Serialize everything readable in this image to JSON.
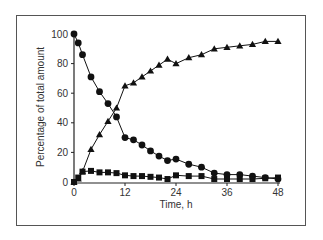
{
  "chart_data": {
    "type": "line",
    "title": "",
    "xlabel": "Time, h",
    "ylabel": "Percentage of total amount",
    "xlim": [
      0,
      48
    ],
    "ylim": [
      0,
      100
    ],
    "xticks": [
      0,
      12,
      24,
      36,
      48
    ],
    "yticks": [
      0,
      20,
      40,
      60,
      80,
      100
    ],
    "grid": false,
    "legend": null,
    "x": [
      0,
      1,
      2,
      4,
      6,
      8,
      10,
      12,
      14,
      16,
      18,
      20,
      22,
      24,
      27,
      30,
      33,
      36,
      39,
      42,
      45,
      48
    ],
    "series": [
      {
        "name": "circles",
        "marker": "circle",
        "color": "#111111",
        "values": [
          100,
          94,
          86,
          71,
          61,
          53,
          44,
          30,
          28.5,
          25,
          21,
          17.5,
          14.5,
          15.5,
          12,
          10,
          6,
          5,
          5,
          4,
          3,
          2
        ]
      },
      {
        "name": "triangles",
        "marker": "triangle",
        "color": "#111111",
        "values": [
          0,
          2,
          7,
          22,
          32,
          41,
          50,
          65,
          67,
          71,
          75,
          79,
          83,
          80,
          84,
          86,
          90,
          91,
          92,
          93,
          95,
          95
        ]
      },
      {
        "name": "squares",
        "marker": "square",
        "color": "#111111",
        "values": [
          0,
          3,
          7,
          7.5,
          6.5,
          6.5,
          6,
          4.5,
          4,
          4,
          3.5,
          3,
          2,
          4.5,
          4,
          4,
          2,
          2,
          2,
          2,
          2.5,
          3
        ]
      }
    ]
  }
}
